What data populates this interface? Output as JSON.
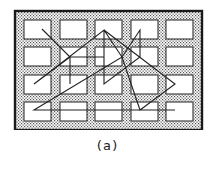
{
  "caption": "(a)",
  "colors": {
    "frame": "#1a1a1a",
    "cell_fill": "#ffffff",
    "cell_stroke": "#333333",
    "dot": "#555555",
    "path": "#222222"
  },
  "grid": {
    "columns": 5,
    "rows": 4,
    "col_x": [
      24,
      60,
      95,
      131,
      166
    ],
    "row_y": [
      20,
      47,
      75,
      102
    ],
    "cell_w": 27,
    "cell_h": 19
  },
  "path_points": [
    [
      42,
      29
    ],
    [
      70,
      57
    ],
    [
      70,
      84
    ],
    [
      70,
      57
    ],
    [
      104,
      57
    ],
    [
      70,
      57
    ],
    [
      34,
      84
    ],
    [
      104,
      30
    ],
    [
      104,
      84
    ],
    [
      140,
      57
    ],
    [
      140,
      30
    ],
    [
      122,
      57
    ],
    [
      104,
      30
    ],
    [
      175,
      84
    ],
    [
      140,
      110
    ],
    [
      122,
      57
    ],
    [
      34,
      110
    ],
    [
      175,
      110
    ]
  ]
}
